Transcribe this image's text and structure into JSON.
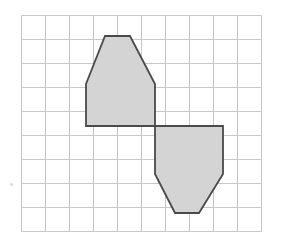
{
  "figure": {
    "background_color": "#ffffff",
    "grid": {
      "origin_x": 21,
      "origin_y": 15,
      "cell_size": 24,
      "columns": 10,
      "rows": 9,
      "line_color": "#c8c8c8",
      "line_width": 1.1,
      "right_edge": 261,
      "bottom_edge": 231
    },
    "shapes": [
      {
        "name": "upper-pentagon",
        "fill_color": "#d4d4d4",
        "stroke_color": "#4a4a4a",
        "stroke_width": 1.8,
        "points": "86,84 105,36 130,36 155,84 155,126 86,126",
        "grid_points": "(2.7,2.9) (3.5,0.9) (4.5,0.9) (5.6,2.9) (5.6,4.6) (2.7,4.6)",
        "vertex_count": 6
      },
      {
        "name": "lower-pentagon",
        "fill_color": "#d4d4d4",
        "stroke_color": "#4a4a4a",
        "stroke_width": 1.8,
        "points": "155,126 223,126 223,174 199,213 175,213 155,174",
        "grid_points": "(5.6,4.6) (8.4,4.6) (8.4,6.6) (7.4,8.3) (6.4,8.3) (5.6,6.6)",
        "vertex_count": 6
      }
    ],
    "artifact": {
      "name": "scan-speck",
      "x": 10,
      "y": 183,
      "color": "#d8d8d8"
    }
  }
}
